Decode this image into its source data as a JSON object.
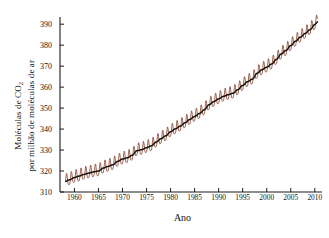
{
  "chart_data": {
    "type": "line",
    "title": "",
    "xlabel": "Ano",
    "ylabel_line1": "Moléculas de CO",
    "ylabel_sub": "2",
    "ylabel_line2": "por milhão de moléculas de ar",
    "grid": false,
    "legend": "none",
    "xlim": [
      1957.0,
      2011.5
    ],
    "ylim": [
      310,
      392
    ],
    "xticks": [
      1960,
      1965,
      1970,
      1975,
      1980,
      1985,
      1990,
      1995,
      2000,
      2005,
      2010
    ],
    "xtick_labels": [
      "1960",
      "1965",
      "1970",
      "1975",
      "1980",
      "1985",
      "1990",
      "1995",
      "2000",
      "2005",
      "2010"
    ],
    "yticks": [
      310,
      320,
      330,
      340,
      350,
      360,
      370,
      380,
      390
    ],
    "ytick_labels": [
      "310",
      "320",
      "330",
      "340",
      "350",
      "360",
      "370",
      "380",
      "390"
    ],
    "series": [
      {
        "name": "Concentração mensal de CO2 (oscilação sazonal)",
        "color": "#8a4a38",
        "seasonal_amplitude_ppm": 3.0,
        "note": "serra sazonal mensal em torno da tendência"
      },
      {
        "name": "Tendência média anual de CO2",
        "color": "#1a1008",
        "x": [
          1958,
          1959,
          1960,
          1961,
          1962,
          1963,
          1964,
          1965,
          1966,
          1967,
          1968,
          1969,
          1970,
          1971,
          1972,
          1973,
          1974,
          1975,
          1976,
          1977,
          1978,
          1979,
          1980,
          1981,
          1982,
          1983,
          1984,
          1985,
          1986,
          1987,
          1988,
          1989,
          1990,
          1991,
          1992,
          1993,
          1994,
          1995,
          1996,
          1997,
          1998,
          1999,
          2000,
          2001,
          2002,
          2003,
          2004,
          2005,
          2006,
          2007,
          2008,
          2009,
          2010
        ],
        "values": [
          315.0,
          315.8,
          316.9,
          317.6,
          318.4,
          319.0,
          319.6,
          320.0,
          321.4,
          322.2,
          323.0,
          324.6,
          325.7,
          326.3,
          327.5,
          329.7,
          330.2,
          331.1,
          332.0,
          333.8,
          335.4,
          336.8,
          338.7,
          340.1,
          341.4,
          343.0,
          344.6,
          346.0,
          347.4,
          349.2,
          351.6,
          353.1,
          354.4,
          355.6,
          356.4,
          357.1,
          358.8,
          360.8,
          362.6,
          363.8,
          366.6,
          368.3,
          369.5,
          371.0,
          373.2,
          375.8,
          377.5,
          379.8,
          381.9,
          383.8,
          385.6,
          387.4,
          389.8
        ]
      }
    ]
  },
  "axes": {
    "axis_color": "#1a1a1a",
    "tick_direction": "in"
  }
}
